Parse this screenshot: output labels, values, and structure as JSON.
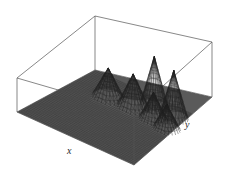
{
  "figure": {
    "kind": "3d-surface-plot",
    "title": "",
    "background_color": "#ffffff",
    "box_line_color": "#555555",
    "mesh_color": "#3a3a3a",
    "surface_fill_color": "#5a5a5a",
    "peak_color": "#222222"
  },
  "axes": {
    "x_label": "x",
    "y_label": "y",
    "z_label": "",
    "x_ticks": [],
    "y_ticks": [],
    "z_ticks": [],
    "grid": true
  },
  "chart_data": {
    "type": "surface",
    "title": "",
    "xlabel": "x",
    "ylabel": "y",
    "zlabel": "",
    "xlim": [
      0,
      1
    ],
    "ylim": [
      0,
      1
    ],
    "zlim": [
      0,
      1
    ],
    "grid": true,
    "legend": null,
    "baseline": 0.0,
    "peaks": [
      {
        "name": "peak-1",
        "x": 0.3,
        "y": 0.72,
        "height": 0.55,
        "width": 0.045
      },
      {
        "name": "peak-2",
        "x": 0.5,
        "y": 0.74,
        "height": 0.62,
        "width": 0.045
      },
      {
        "name": "peak-3",
        "x": 0.6,
        "y": 0.86,
        "height": 0.95,
        "width": 0.04
      },
      {
        "name": "peak-4",
        "x": 0.7,
        "y": 0.7,
        "height": 0.5,
        "width": 0.04
      },
      {
        "name": "peak-5",
        "x": 0.78,
        "y": 0.84,
        "height": 0.88,
        "width": 0.04
      },
      {
        "name": "peak-6",
        "x": 0.84,
        "y": 0.66,
        "height": 0.45,
        "width": 0.038
      }
    ],
    "peak_count": 6,
    "mesh_resolution": {
      "nx": 60,
      "ny": 48
    }
  },
  "geometry": {
    "box_vertices": {
      "top_back": [
        95,
        16
      ],
      "top_right": [
        212,
        42
      ],
      "top_left": [
        17,
        78
      ],
      "top_front": [
        134,
        112
      ],
      "base_back": [
        95,
        70
      ],
      "base_right": [
        212,
        97
      ],
      "base_left": [
        17,
        112
      ],
      "base_front": [
        134,
        165
      ]
    }
  }
}
